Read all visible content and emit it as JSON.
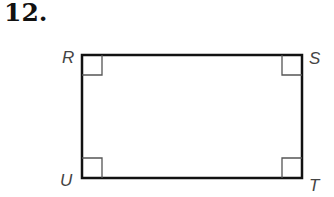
{
  "problem_number": "12.",
  "figure": {
    "type": "rectangle",
    "vertices": [
      {
        "label": "R",
        "position": "top-left"
      },
      {
        "label": "S",
        "position": "top-right"
      },
      {
        "label": "T",
        "position": "bottom-right"
      },
      {
        "label": "U",
        "position": "bottom-left"
      }
    ],
    "right_angle_marks": 4
  }
}
